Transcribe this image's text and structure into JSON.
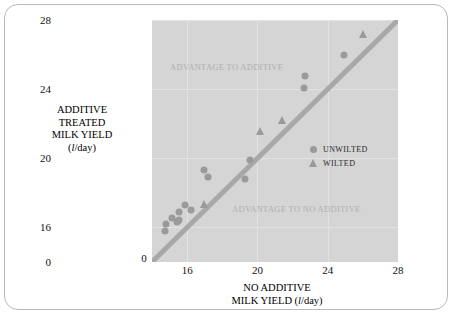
{
  "chart_data": {
    "type": "scatter",
    "title": "",
    "xlabel_line1": "NO ADDITIVE",
    "xlabel_line2_pre": "MILK YIELD (",
    "xlabel_italic": "l",
    "xlabel_line2_post": "/day)",
    "ylabel_line1": "ADDITIVE",
    "ylabel_line2": "TREATED",
    "ylabel_line3": "MILK YIELD",
    "ylabel_line4_pre": "(",
    "ylabel_italic": "l",
    "ylabel_line4_post": "/day)",
    "xlim": [
      14,
      28
    ],
    "ylim": [
      14,
      28
    ],
    "xticks": [
      "0",
      "16",
      "20",
      "24",
      "28"
    ],
    "xtick_values": [
      14,
      16,
      20,
      24,
      28
    ],
    "yticks": [
      "0",
      "16",
      "20",
      "24",
      "28"
    ],
    "ytick_values": [
      14,
      16,
      20,
      24,
      28
    ],
    "grid": true,
    "axis_broken": true,
    "reference_line": {
      "label": "y = x parity line",
      "from": [
        14,
        14
      ],
      "to": [
        28,
        28
      ],
      "color": "#a8a8a8",
      "width": 5
    },
    "legend_position": "inside-right",
    "series": [
      {
        "name": "UNWILTED",
        "marker": "circle",
        "color": "#9a9a9a",
        "points": [
          [
            14.75,
            15.8
          ],
          [
            14.8,
            16.2
          ],
          [
            15.15,
            16.55
          ],
          [
            15.4,
            16.3
          ],
          [
            15.5,
            16.35
          ],
          [
            15.55,
            16.9
          ],
          [
            15.55,
            16.45
          ],
          [
            15.85,
            17.3
          ],
          [
            16.2,
            17.0
          ],
          [
            16.95,
            19.3
          ],
          [
            17.2,
            18.9
          ],
          [
            19.3,
            18.8
          ],
          [
            22.7,
            24.75
          ],
          [
            22.65,
            24.05
          ],
          [
            24.95,
            26.0
          ],
          [
            19.55,
            19.9
          ]
        ]
      },
      {
        "name": "WILTED",
        "marker": "triangle",
        "color": "#9a9a9a",
        "points": [
          [
            16.95,
            17.35
          ],
          [
            20.15,
            21.6
          ],
          [
            21.4,
            22.2
          ],
          [
            26.0,
            27.2
          ]
        ]
      }
    ],
    "annotations": [
      {
        "text": "ADVANTAGE TO ADDITIVE",
        "x": 15.2,
        "y": 25.6,
        "color": "#b0b0b0"
      },
      {
        "text": "ADVANTAGE TO NO ADDITIVE",
        "x": 18.8,
        "y": 17.1,
        "color": "#b0b0b0"
      }
    ],
    "colors": {
      "plot_background": "#d5d5d5",
      "grid": "#e2e2e2",
      "marker": "#9a9a9a",
      "reference_line": "#a8a8a8",
      "annotation": "#b0b0b0",
      "text": "#111111",
      "frame": "#b9b9b9"
    }
  },
  "legend": {
    "items": [
      {
        "label": "UNWILTED",
        "marker": "circle"
      },
      {
        "label": "WILTED",
        "marker": "triangle"
      }
    ]
  }
}
